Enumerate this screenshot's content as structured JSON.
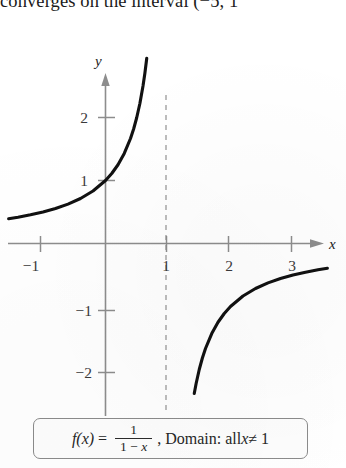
{
  "page": {
    "top_text": "converges on the interval (−5, 1"
  },
  "caption": {
    "fn_lhs": "f(x)",
    "equals": "=",
    "numerator": "1",
    "denominator_left": "1 − ",
    "denominator_var": "x",
    "comma": ",",
    "domain_prefix": "Domain: all ",
    "domain_var": "x",
    "domain_rest": " ≠ 1"
  },
  "chart_data": {
    "type": "line",
    "title": "",
    "subtitle": "",
    "function": "f(x) = 1/(1 - x)",
    "xlabel": "x",
    "ylabel": "y",
    "xlim": [
      -1.55,
      3.8
    ],
    "ylim": [
      -2.45,
      2.55
    ],
    "xticks": [
      -1,
      1,
      2,
      3
    ],
    "xtick_labels": [
      "−1",
      "1",
      "2",
      "3"
    ],
    "yticks": [
      1,
      2,
      -1,
      -2
    ],
    "ytick_labels": [
      "1",
      "2",
      "−1",
      "−2"
    ],
    "grid": false,
    "legend": null,
    "annotations": [
      {
        "type": "vertical-asymptote",
        "x": 1,
        "style": "dashed",
        "label": "x = 1"
      }
    ],
    "series": [
      {
        "name": "left-branch",
        "comment": "f(x)=1/(1-x) for x < 1",
        "x": [
          -1.55,
          -1.4,
          -1.2,
          -1.0,
          -0.8,
          -0.6,
          -0.4,
          -0.2,
          0.0,
          0.1,
          0.2,
          0.3,
          0.4,
          0.45,
          0.5,
          0.55,
          0.6,
          0.63,
          0.66
        ],
        "y": [
          0.392,
          0.417,
          0.455,
          0.5,
          0.556,
          0.625,
          0.714,
          0.833,
          1.0,
          1.111,
          1.25,
          1.429,
          1.667,
          1.818,
          2.0,
          2.222,
          2.5,
          2.703,
          2.941
        ]
      },
      {
        "name": "right-branch",
        "comment": "f(x)=1/(1-x) for x > 1",
        "x": [
          1.42,
          1.45,
          1.5,
          1.55,
          1.6,
          1.7,
          1.8,
          1.9,
          2.0,
          2.2,
          2.4,
          2.6,
          2.8,
          3.0,
          3.2,
          3.4,
          3.55
        ],
        "y": [
          -2.381,
          -2.222,
          -2.0,
          -1.818,
          -1.667,
          -1.429,
          -1.25,
          -1.111,
          -1.0,
          -0.833,
          -0.714,
          -0.625,
          -0.556,
          -0.5,
          -0.455,
          -0.417,
          -0.392
        ]
      }
    ],
    "colors": {
      "curve": "#111111",
      "axis": "#8d8d8d",
      "asymptote": "#9a9a9a",
      "tick_text": "#3a3a3a"
    }
  },
  "icons": {
    "x_axis_arrow": "arrow-right-icon",
    "y_axis_arrow": "arrow-up-icon"
  }
}
